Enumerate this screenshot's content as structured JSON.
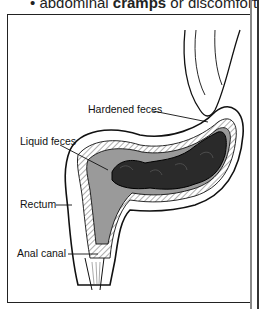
{
  "top_text": {
    "bullet": "•",
    "prefix": "abdominal ",
    "bold": "cramps",
    "suffix": " or discomfort"
  },
  "diagram": {
    "labels": {
      "hardened_feces": "Hardened feces",
      "liquid_feces": "Liquid feces",
      "rectum": "Rectum",
      "anal_canal": "Anal canal"
    },
    "colors": {
      "hardened": "#2a2a2a",
      "liquid": "#9a9a9a",
      "wall": "#ffffff",
      "outline": "#111111"
    }
  }
}
